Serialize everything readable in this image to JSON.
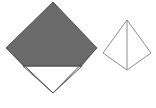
{
  "canvas": {
    "width": 156,
    "height": 108,
    "background_color": "#ffffff"
  },
  "colors": {
    "fill_gray": "#6b6b6b",
    "stroke_dark": "#555555",
    "stroke_light": "#8d8d8d",
    "white": "#ffffff"
  },
  "figures": [
    {
      "id": "left-diamond",
      "name": "partially-shaded-diamond",
      "outline_points": "53,2 97,48 53,93 6,48",
      "shaded_region_points": "53,2 97,48 82,66 23,66 6,48",
      "unshaded_region_points": "23,66 82,66 53,93",
      "divider_line": {
        "x1": 23,
        "y1": 66,
        "x2": 82,
        "y2": 66
      },
      "shaded_fill": "#6b6b6b",
      "unshaded_fill": "#ffffff",
      "stroke": "#555555",
      "stroke_width": 1
    },
    {
      "id": "right-diamond",
      "name": "bisected-diamond",
      "outline_points": "127,20 151,53 127,70 103,53",
      "left_half_points": "127,20 127,70 103,53",
      "right_half_points": "127,20 151,53 127,70",
      "divider_line": {
        "x1": 127,
        "y1": 20,
        "x2": 127,
        "y2": 70
      },
      "fill": "#ffffff",
      "stroke": "#8d8d8d",
      "stroke_width": 1
    }
  ]
}
